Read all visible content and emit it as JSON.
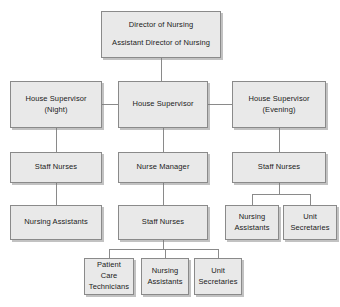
{
  "chart": {
    "type": "org-chart",
    "style": {
      "box_fill": "#e9e9e9",
      "box_border": "#8a8a8a",
      "connector": "#8a8a8a",
      "background": "#ffffff",
      "text_color": "#1b1b1b"
    },
    "nodes": [
      {
        "id": "director",
        "lines": [
          "Director of Nursing",
          "Assistant Director of Nursing"
        ],
        "x": 101,
        "y": 11,
        "w": 120,
        "h": 47
      },
      {
        "id": "house-supervisor-night",
        "lines": [
          "House Supervisor",
          "(Night)"
        ],
        "x": 10,
        "y": 81,
        "w": 92,
        "h": 47
      },
      {
        "id": "house-supervisor",
        "lines": [
          "House Supervisor"
        ],
        "x": 118,
        "y": 81,
        "w": 90,
        "h": 47
      },
      {
        "id": "house-supervisor-evening",
        "lines": [
          "House Supervisor",
          "(Evening)"
        ],
        "x": 232,
        "y": 81,
        "w": 94,
        "h": 47
      },
      {
        "id": "staff-nurses-left",
        "lines": [
          "Staff Nurses"
        ],
        "x": 10,
        "y": 152,
        "w": 92,
        "h": 31
      },
      {
        "id": "nurse-manager",
        "lines": [
          "Nurse Manager"
        ],
        "x": 118,
        "y": 152,
        "w": 90,
        "h": 31
      },
      {
        "id": "staff-nurses-right",
        "lines": [
          "Staff Nurses"
        ],
        "x": 232,
        "y": 152,
        "w": 94,
        "h": 31
      },
      {
        "id": "nursing-assistants-left",
        "lines": [
          "Nursing Assistants"
        ],
        "x": 10,
        "y": 205,
        "w": 92,
        "h": 35
      },
      {
        "id": "staff-nurses-center",
        "lines": [
          "Staff Nurses"
        ],
        "x": 118,
        "y": 205,
        "w": 90,
        "h": 35
      },
      {
        "id": "nursing-assistants-right",
        "lines": [
          "Nursing",
          "Assistants"
        ],
        "x": 225,
        "y": 205,
        "w": 54,
        "h": 35
      },
      {
        "id": "unit-secretaries-right",
        "lines": [
          "Unit",
          "Secretaries"
        ],
        "x": 283,
        "y": 205,
        "w": 54,
        "h": 35
      },
      {
        "id": "patient-care-technicians",
        "lines": [
          "Patient",
          "Care",
          "Technicians"
        ],
        "x": 84,
        "y": 258,
        "w": 50,
        "h": 37
      },
      {
        "id": "nursing-assistants-bottom",
        "lines": [
          "Nursing",
          "Assistants"
        ],
        "x": 141,
        "y": 258,
        "w": 48,
        "h": 37
      },
      {
        "id": "unit-secretaries-bottom",
        "lines": [
          "Unit",
          "Secretaries"
        ],
        "x": 194,
        "y": 258,
        "w": 48,
        "h": 37
      }
    ],
    "edges": [
      {
        "from": "director",
        "to": "house-supervisor"
      },
      {
        "from": "house-supervisor",
        "to": "house-supervisor-night"
      },
      {
        "from": "house-supervisor",
        "to": "house-supervisor-evening"
      },
      {
        "from": "house-supervisor-night",
        "to": "staff-nurses-left"
      },
      {
        "from": "house-supervisor",
        "to": "nurse-manager"
      },
      {
        "from": "house-supervisor-evening",
        "to": "staff-nurses-right"
      },
      {
        "from": "staff-nurses-left",
        "to": "nursing-assistants-left"
      },
      {
        "from": "nurse-manager",
        "to": "staff-nurses-center"
      },
      {
        "from": "staff-nurses-right",
        "to": "nursing-assistants-right"
      },
      {
        "from": "staff-nurses-right",
        "to": "unit-secretaries-right"
      },
      {
        "from": "staff-nurses-center",
        "to": "patient-care-technicians"
      },
      {
        "from": "staff-nurses-center",
        "to": "nursing-assistants-bottom"
      },
      {
        "from": "staff-nurses-center",
        "to": "unit-secretaries-bottom"
      }
    ]
  }
}
